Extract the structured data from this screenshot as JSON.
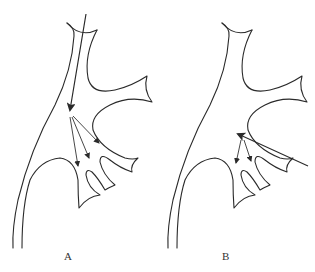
{
  "figure": {
    "panels": [
      {
        "id": "A",
        "label": "A",
        "description": "Downward flow from top into pelvis, dispersing into lower calyces"
      },
      {
        "id": "B",
        "label": "B",
        "description": "Flow entering from lower right side, dispersing into lower calyces"
      }
    ],
    "colors": {
      "stroke": "#2a2a2a",
      "background": "#ffffff"
    }
  }
}
